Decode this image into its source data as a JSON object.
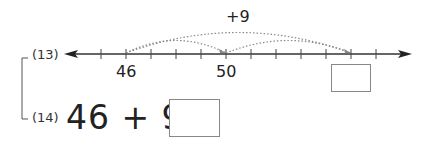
{
  "problems": [
    {
      "number": "(13)"
    },
    {
      "number": "(14)",
      "equation": "46 + 9 ="
    }
  ],
  "number_line": {
    "ticks": [
      45,
      46,
      47,
      48,
      49,
      50,
      51,
      52,
      53,
      54,
      55,
      56
    ],
    "labels": [
      {
        "value": 46,
        "text": "46"
      },
      {
        "value": 50,
        "text": "50"
      }
    ],
    "jump_label": "+9",
    "jumps": [
      {
        "from": 46,
        "to": 50,
        "style": "dotted"
      },
      {
        "from": 50,
        "to": 55,
        "style": "dotted"
      },
      {
        "from": 46,
        "to": 55,
        "style": "dotted",
        "label": "+9"
      }
    ],
    "answer_at": 55
  },
  "colors": {
    "line": "#333333",
    "dotted": "#888888",
    "box_border": "#888888"
  }
}
